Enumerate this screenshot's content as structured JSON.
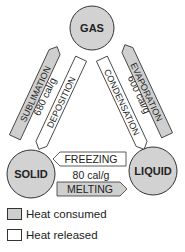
{
  "colors": {
    "consumed_fill": "#cfcfcf",
    "released_fill": "#ffffff",
    "circle_fill": "#d2d2d2",
    "stroke": "#333333"
  },
  "states": {
    "gas": "GAS",
    "solid": "SOLID",
    "liquid": "LIQUID"
  },
  "transitions": {
    "sublimation": "SUBLIMATION",
    "deposition": "DEPOSITION",
    "solid_gas_energy": "680 cal/g",
    "evaporation": "EVAPORATION",
    "condensation": "CONDENSATION",
    "liquid_gas_energy": "600 cal/g",
    "freezing": "FREEZING",
    "melting": "MELTING",
    "solid_liquid_energy": "80 cal/g"
  },
  "legend": {
    "consumed": "Heat consumed",
    "released": "Heat released"
  }
}
